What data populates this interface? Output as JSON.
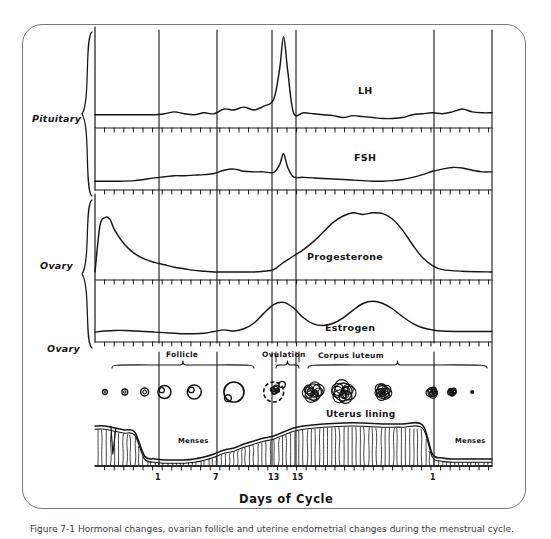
{
  "figure": {
    "title_axis": "Days of Cycle",
    "caption": "Figure 7-1  Hormonal changes, ovarian follicle and uterine endometrial changes during the menstrual cycle."
  },
  "side_labels": [
    {
      "id": "pituitary",
      "text": "Pituitary"
    },
    {
      "id": "ovary-hormones",
      "text": "Ovary"
    },
    {
      "id": "ovary-structures",
      "text": "Ovary"
    }
  ],
  "curve_labels": [
    {
      "id": "lh",
      "text": "LH"
    },
    {
      "id": "fsh",
      "text": "FSH"
    },
    {
      "id": "progesterone",
      "text": "Progesterone"
    },
    {
      "id": "estrogen",
      "text": "Estrogen"
    }
  ],
  "phase_labels": [
    {
      "id": "follicle",
      "text": "Follicle"
    },
    {
      "id": "ovulation",
      "text": "Ovulation"
    },
    {
      "id": "corpus-luteum",
      "text": "Corpus luteum"
    }
  ],
  "uterus_labels": [
    {
      "id": "uterus-lining",
      "text": "Uterus lining"
    },
    {
      "id": "menses-left",
      "text": "Menses"
    },
    {
      "id": "menses-right",
      "text": "Menses"
    }
  ],
  "axis": {
    "label": "Days of Cycle",
    "ticks": [
      {
        "day": "1",
        "x": 159
      },
      {
        "day": "7",
        "x": 217
      },
      {
        "day": "13",
        "x": 272
      },
      {
        "day": "15",
        "x": 296
      },
      {
        "day": "1",
        "x": 434
      }
    ],
    "gridlines_x": [
      159,
      217,
      272,
      296,
      434,
      492
    ],
    "minor_tick_spacing_px": 9.6
  },
  "colors": {
    "ink": "#161616",
    "frame": "#7a7a7a",
    "grid": "#1a1a1a",
    "paper": "#ffffff",
    "caption": "#3a3a3a"
  },
  "chart_data": {
    "type": "line",
    "xlabel": "Days of Cycle",
    "ylabel": "Relative hormone level",
    "xlim": [
      -5,
      36
    ],
    "grid": true,
    "legend": "inline-labels",
    "x_tick_labels": [
      "1",
      "7",
      "13",
      "15",
      "1"
    ],
    "x_tick_days": [
      1,
      7,
      13,
      15,
      29
    ],
    "panels": [
      {
        "name": "LH",
        "source": "Pituitary",
        "ylabel": "LH",
        "ylim": [
          0,
          100
        ],
        "x": [
          -5,
          -3,
          -1,
          1,
          2,
          3,
          4,
          5,
          6,
          7,
          8,
          9,
          10,
          11,
          12,
          13,
          13.6,
          14,
          14.4,
          15,
          16,
          17,
          18,
          19,
          20,
          21,
          22,
          23,
          24,
          25,
          26,
          27,
          28,
          29,
          30,
          31,
          32,
          33,
          34,
          35
        ],
        "y": [
          14,
          14,
          14,
          14,
          15,
          17,
          15,
          14,
          16,
          15,
          20,
          19,
          22,
          19,
          23,
          30,
          62,
          96,
          62,
          16,
          16,
          15,
          14,
          13,
          11,
          13,
          12,
          11,
          10,
          10,
          11,
          14,
          15,
          16,
          15,
          17,
          20,
          17,
          16,
          16
        ]
      },
      {
        "name": "FSH",
        "source": "Pituitary",
        "ylabel": "FSH",
        "ylim": [
          0,
          100
        ],
        "x": [
          -5,
          -3,
          -1,
          1,
          2,
          3,
          4,
          5,
          6,
          7,
          8,
          9,
          10,
          11,
          12,
          13,
          13.6,
          14,
          14.4,
          15,
          16,
          17,
          18,
          19,
          20,
          21,
          22,
          23,
          24,
          25,
          26,
          27,
          28,
          29,
          30,
          31,
          32,
          33,
          34,
          35
        ],
        "y": [
          16,
          16,
          17,
          22,
          24,
          26,
          26,
          27,
          28,
          30,
          36,
          38,
          34,
          33,
          33,
          32,
          46,
          66,
          42,
          24,
          23,
          22,
          21,
          20,
          19,
          18,
          17,
          16,
          16,
          17,
          19,
          23,
          28,
          34,
          38,
          41,
          40,
          36,
          33,
          33
        ]
      },
      {
        "name": "Progesterone",
        "source": "Ovary",
        "ylabel": "Progesterone",
        "ylim": [
          0,
          100
        ],
        "x": [
          -5,
          -4.5,
          -4,
          -3.5,
          -3,
          -2,
          -1,
          0,
          1,
          2,
          3,
          4,
          5,
          6,
          7,
          8,
          9,
          10,
          11,
          12,
          13,
          14,
          15,
          16,
          17,
          18,
          19,
          20,
          21,
          22,
          23,
          24,
          25,
          26,
          27,
          28,
          29,
          30,
          32,
          35
        ],
        "y": [
          10,
          68,
          78,
          76,
          62,
          44,
          33,
          26,
          22,
          19,
          16,
          14,
          12,
          11,
          10,
          10,
          10,
          10,
          10,
          11,
          13,
          22,
          30,
          38,
          48,
          60,
          72,
          80,
          84,
          82,
          84,
          83,
          76,
          62,
          44,
          28,
          18,
          13,
          11,
          10
        ]
      },
      {
        "name": "Estrogen",
        "source": "Ovary",
        "ylabel": "Estrogen",
        "ylim": [
          0,
          100
        ],
        "x": [
          -5,
          -4,
          -3,
          -2,
          -1,
          0,
          1,
          2,
          3,
          4,
          5,
          6,
          7,
          8,
          9,
          10,
          11,
          12,
          13,
          14,
          15,
          16,
          17,
          18,
          19,
          20,
          21,
          22,
          23,
          24,
          25,
          26,
          27,
          28,
          29,
          30,
          32,
          35
        ],
        "y": [
          18,
          20,
          21,
          21,
          20,
          19,
          18,
          17,
          16,
          15,
          15,
          16,
          19,
          22,
          20,
          24,
          34,
          52,
          68,
          72,
          62,
          44,
          33,
          30,
          34,
          44,
          58,
          70,
          74,
          70,
          60,
          46,
          34,
          26,
          22,
          20,
          19,
          19
        ]
      }
    ],
    "ovary_structures": [
      {
        "day": -4,
        "stage": "primordial-follicle",
        "size_px": 5
      },
      {
        "day": -2,
        "stage": "primordial-follicle",
        "size_px": 6
      },
      {
        "day": 0,
        "stage": "primary-follicle",
        "size_px": 8
      },
      {
        "day": 2,
        "stage": "primary-follicle",
        "size_px": 13
      },
      {
        "day": 5,
        "stage": "secondary-follicle",
        "size_px": 14
      },
      {
        "day": 9,
        "stage": "graafian-follicle",
        "size_px": 20
      },
      {
        "day": 13,
        "stage": "ovulating-follicle",
        "size_px": 20
      },
      {
        "day": 17,
        "stage": "corpus-luteum",
        "size_px": 20
      },
      {
        "day": 20,
        "stage": "corpus-luteum",
        "size_px": 22
      },
      {
        "day": 24,
        "stage": "corpus-luteum",
        "size_px": 16
      },
      {
        "day": 29,
        "stage": "corpus-albicans",
        "size_px": 11
      },
      {
        "day": 31,
        "stage": "corpus-albicans",
        "size_px": 8
      },
      {
        "day": 33,
        "stage": "degenerated",
        "size_px": 3
      }
    ],
    "uterus_lining": {
      "description": "Endometrial thickness across the cycle",
      "x": [
        -5,
        -4,
        -3,
        -2,
        -1,
        0,
        1,
        2,
        3,
        4,
        5,
        6,
        7,
        8,
        9,
        10,
        11,
        12,
        13,
        14,
        15,
        16,
        18,
        20,
        22,
        24,
        26,
        28,
        29,
        30,
        31,
        33,
        35
      ],
      "thickness": [
        40,
        40,
        38,
        36,
        34,
        10,
        7,
        6,
        6,
        6,
        7,
        9,
        12,
        16,
        18,
        22,
        25,
        28,
        30,
        34,
        38,
        40,
        42,
        43,
        43,
        42,
        42,
        41,
        12,
        8,
        7,
        7,
        7
      ],
      "menses_spans": [
        [
          -5,
          0
        ],
        [
          29,
          35
        ]
      ]
    }
  }
}
